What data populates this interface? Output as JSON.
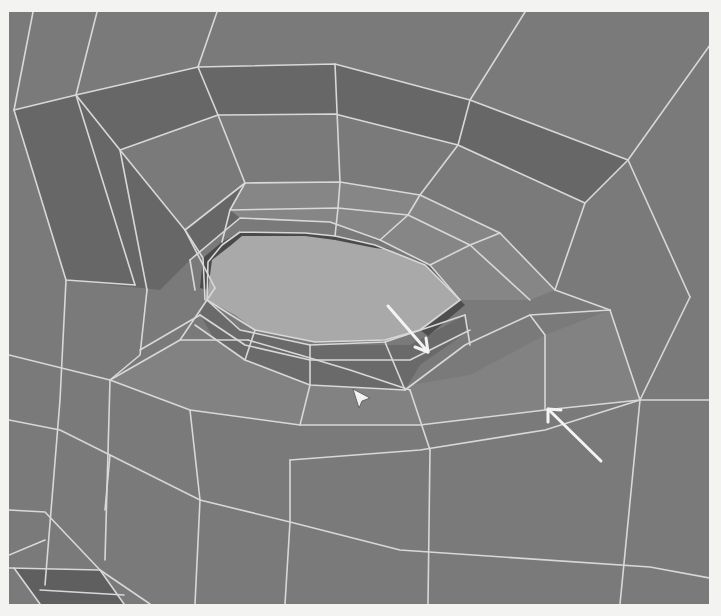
{
  "viewport": {
    "label": "3D viewport - eye socket polygon mesh",
    "render_mode": "flat shaded with wireframe",
    "colors": {
      "page_background": "#f3f3f1",
      "base_face": "#7a7a7a",
      "dark_face": "#676767",
      "light_face": "#868686",
      "eye_hole_face": "#a9a9a9",
      "inner_rim_dark": "#4a4a4a",
      "wire": "#d8d8d8",
      "annotation_arrow": "#f4f4f4"
    }
  },
  "annotations": [
    {
      "name": "arrow-inner-edge-loop",
      "from": [
        388,
        306
      ],
      "to": [
        428,
        352
      ]
    },
    {
      "name": "arrow-outer-edge-loop",
      "from": [
        601,
        461
      ],
      "to": [
        548,
        409
      ]
    }
  ],
  "cursor": {
    "icon": "arrow-pointer",
    "position": [
      357,
      393
    ]
  }
}
